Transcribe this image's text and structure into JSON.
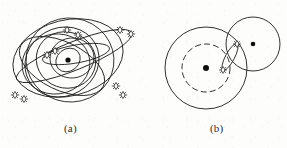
{
  "figure": {
    "panels": [
      {
        "id": "a",
        "caption": "(a)",
        "description": "multiple inclined elliptical orbits about a central body with satellite pairs",
        "center_body": "earth-center-dot",
        "satellite_count": 10
      },
      {
        "id": "b",
        "caption": "(b)",
        "description": "two-body circular orbits joined by a transfer orbit carrying two satellites",
        "center_body": "earth-center-dot",
        "secondary_body": "moon-center-dot",
        "satellite_count": 2
      }
    ],
    "colors": {
      "ink": "#1b1b1b",
      "body": "#0d0d0d",
      "paper": "#fdfdfc"
    },
    "icons": {
      "satellite": "satellite-icon",
      "center_body": "central-body-dot-icon"
    }
  }
}
